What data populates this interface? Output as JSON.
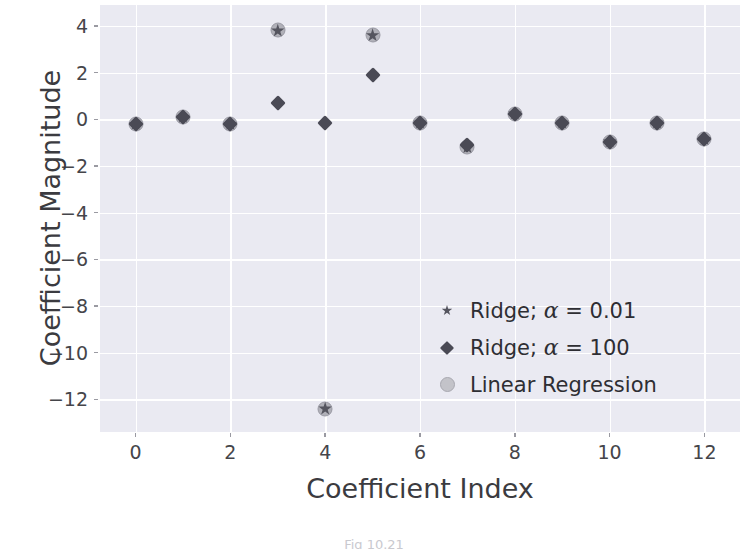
{
  "chart_data": {
    "type": "scatter",
    "title": "",
    "xlabel": "Coefficient Index",
    "ylabel": "Coefficient Magnitude",
    "x": [
      0,
      1,
      2,
      3,
      4,
      5,
      6,
      7,
      8,
      9,
      10,
      11,
      12
    ],
    "xticks": [
      0,
      2,
      4,
      6,
      8,
      10,
      12
    ],
    "yticks": [
      4,
      2,
      0,
      -2,
      -4,
      -6,
      -8,
      -10,
      -12
    ],
    "xlim": [
      -0.75,
      12.75
    ],
    "ylim": [
      -13.4,
      4.9
    ],
    "grid": true,
    "legend_position": "lower right",
    "series": [
      {
        "name": "Ridge; α = 0.01",
        "marker": "star",
        "color": "#55555f",
        "values": [
          -0.2,
          0.1,
          -0.2,
          3.8,
          -12.4,
          3.6,
          -0.15,
          -1.2,
          0.25,
          -0.15,
          -0.95,
          -0.15,
          -0.85
        ]
      },
      {
        "name": "Ridge; α = 100",
        "marker": "diamond",
        "color": "#4a4a55",
        "values": [
          -0.2,
          0.1,
          -0.2,
          0.7,
          -0.15,
          1.9,
          -0.15,
          -1.1,
          0.25,
          -0.15,
          -0.95,
          -0.15,
          -0.85
        ]
      },
      {
        "name": "Linear Regression",
        "marker": "circle",
        "color": "#b0b0b8",
        "values": [
          -0.2,
          0.1,
          -0.2,
          3.85,
          -12.4,
          3.6,
          -0.15,
          -1.2,
          0.25,
          -0.15,
          -0.95,
          -0.15,
          -0.85
        ]
      }
    ]
  },
  "axes": {
    "ylabel": "Coefficient Magnitude",
    "xlabel": "Coefficient Index",
    "ytick_labels": [
      "4",
      "2",
      "0",
      "−2",
      "−4",
      "−6",
      "−8",
      "−10",
      "−12"
    ],
    "xtick_labels": [
      "0",
      "2",
      "4",
      "6",
      "8",
      "10",
      "12"
    ]
  },
  "legend": {
    "entries": [
      {
        "label_prefix": "Ridge; ",
        "symbol": "α",
        "label_suffix": " = 0.01",
        "marker": "star-icon"
      },
      {
        "label_prefix": "Ridge; ",
        "symbol": "α",
        "label_suffix": " = 100",
        "marker": "diamond-icon"
      },
      {
        "label_prefix": "Linear Regression",
        "symbol": "",
        "label_suffix": "",
        "marker": "circle-icon"
      }
    ]
  },
  "caption": {
    "text": "Fig 10.21"
  },
  "colors": {
    "panel_background": "#eaeaf2",
    "gridline": "#ffffff",
    "figure_background": "#ffffff",
    "ridge_small_alpha": "#55555f",
    "ridge_large_alpha": "#4a4a55",
    "linear_regression": "#b0b0b8",
    "tick_label": "#45454a",
    "axis_title": "#3b3b40"
  }
}
